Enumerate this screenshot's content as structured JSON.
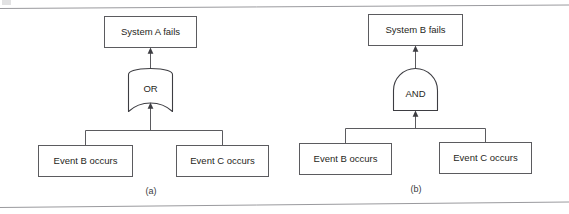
{
  "figure": {
    "background_color": "#ffffff",
    "line_color": "#5b5b5f",
    "rule_color": "#9a9a9e",
    "text_color": "#1f1f22",
    "top_rule": "horizontal-rule",
    "bottom_rule": "horizontal-rule"
  },
  "diagrams": [
    {
      "id": "a",
      "caption": "(a)",
      "top_event": "System A fails",
      "gate": {
        "type": "OR",
        "label": "OR"
      },
      "basic_events": [
        "Event B occurs",
        "Event C occurs"
      ]
    },
    {
      "id": "b",
      "caption": "(b)",
      "top_event": "System B fails",
      "gate": {
        "type": "AND",
        "label": "AND"
      },
      "basic_events": [
        "Event B occurs",
        "Event C occurs"
      ]
    }
  ]
}
